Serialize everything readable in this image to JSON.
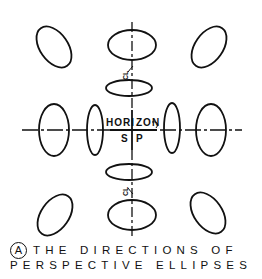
{
  "diagram": {
    "labels": {
      "horizon_left": "HORI",
      "horizon_right": "ZON",
      "sp_left": "S",
      "sp_right": "P",
      "cl_top": "CL",
      "cl_bottom": "CL"
    },
    "caption": {
      "marker": "A",
      "line1": "THE DIRECTIONS OF",
      "line2": "PERSPECTIVE ELLIPSES"
    },
    "ellipses": [
      {
        "id": "top-left",
        "cx": 54,
        "cy": 47,
        "rx": 14,
        "ry": 23,
        "rotate": 35
      },
      {
        "id": "top-center",
        "cx": 132,
        "cy": 45,
        "rx": 24,
        "ry": 15,
        "rotate": 0
      },
      {
        "id": "top-right",
        "cx": 209,
        "cy": 47,
        "rx": 14,
        "ry": 23,
        "rotate": -35
      },
      {
        "id": "upper-center-small",
        "cx": 129,
        "cy": 88,
        "rx": 23,
        "ry": 8,
        "rotate": 0
      },
      {
        "id": "left-big",
        "cx": 54,
        "cy": 130,
        "rx": 15,
        "ry": 26,
        "rotate": 0
      },
      {
        "id": "left-small",
        "cx": 95,
        "cy": 130,
        "rx": 8,
        "ry": 25,
        "rotate": 0
      },
      {
        "id": "right-small",
        "cx": 172,
        "cy": 128,
        "rx": 8,
        "ry": 25,
        "rotate": 0
      },
      {
        "id": "right-big",
        "cx": 211,
        "cy": 130,
        "rx": 15,
        "ry": 26,
        "rotate": 0
      },
      {
        "id": "lower-center-small",
        "cx": 129,
        "cy": 172,
        "rx": 23,
        "ry": 8,
        "rotate": 0
      },
      {
        "id": "bottom-center",
        "cx": 132,
        "cy": 215,
        "rx": 24,
        "ry": 15,
        "rotate": 0
      },
      {
        "id": "bottom-left",
        "cx": 55,
        "cy": 215,
        "rx": 14,
        "ry": 23,
        "rotate": -35
      },
      {
        "id": "bottom-right",
        "cx": 208,
        "cy": 213,
        "rx": 14,
        "ry": 23,
        "rotate": 35
      }
    ],
    "colors": {
      "ink": "#111111",
      "background": "#ffffff"
    }
  }
}
